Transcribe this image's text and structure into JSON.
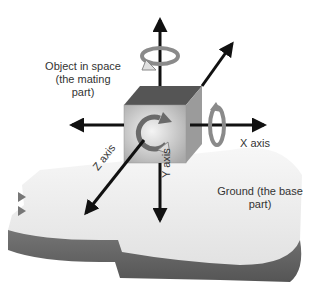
{
  "diagram": {
    "object_label_line1": "Object in space",
    "object_label_line2": "(the mating",
    "object_label_line3": "part)",
    "x_axis_label": "X axis",
    "y_axis_label": "Y axis",
    "z_axis_label": "Z axis",
    "ground_label_line1": "Ground (the base",
    "ground_label_line2": "part)"
  },
  "colors": {
    "arrow": "#111111",
    "cube_front": "#c8c8c8",
    "cube_top": "#5a5a5a",
    "cube_side": "#a0a0a0",
    "ground_top": "#f0f0f0",
    "ground_side": "#6e6e6e",
    "rotation_arrow": "#8a8a8a"
  }
}
